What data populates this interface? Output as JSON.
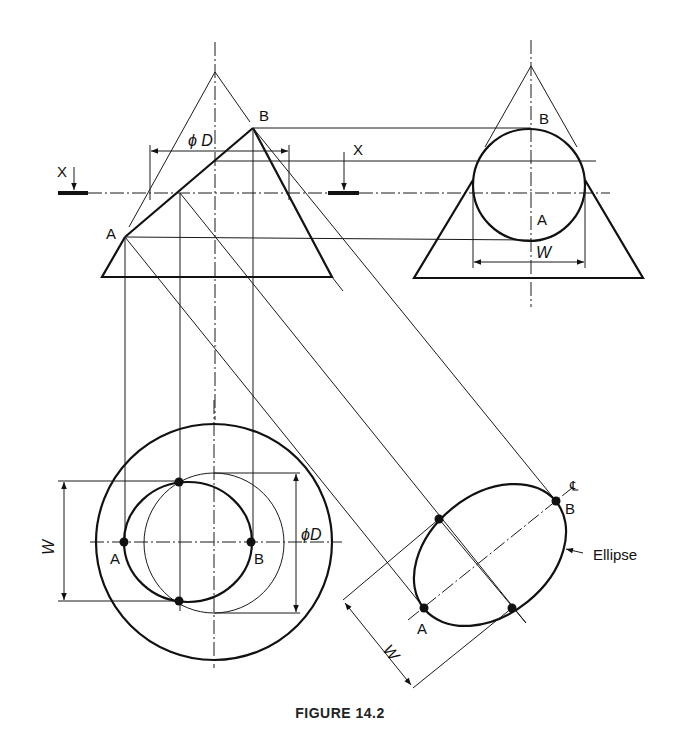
{
  "figure": {
    "caption": "FIGURE 14.2"
  },
  "labels": {
    "front_view": {
      "A": "A",
      "B": "B",
      "diameter": "ϕ D"
    },
    "section_marks": {
      "left": "X",
      "right": "X"
    },
    "side_view": {
      "A": "A",
      "B": "B",
      "width": "W"
    },
    "top_view": {
      "A": "A",
      "B": "B",
      "width": "W",
      "diameter": "ϕD"
    },
    "aux_view": {
      "A": "A",
      "B": "B",
      "width": "W",
      "centerline": "℄",
      "ellipse": "Ellipse"
    }
  },
  "colors": {
    "line": "#111111",
    "background": "#ffffff"
  }
}
